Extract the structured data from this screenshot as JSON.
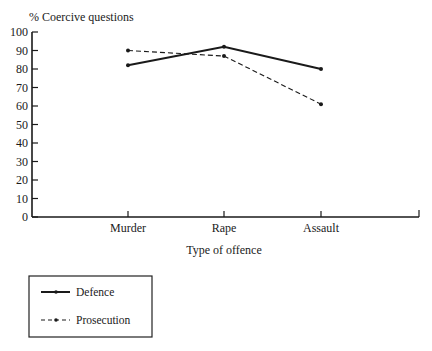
{
  "chart_data": {
    "type": "line",
    "title": "",
    "ylabel": "% Coercive questions",
    "xlabel": "Type of offence",
    "ylim": [
      0,
      100
    ],
    "yticks": [
      0,
      10,
      20,
      30,
      40,
      50,
      60,
      70,
      80,
      90,
      100
    ],
    "categories": [
      "Murder",
      "Rape",
      "Assault"
    ],
    "grid": false,
    "legend_position": "bottom-left",
    "series": [
      {
        "name": "Defence",
        "style": "solid",
        "values": [
          82,
          92,
          80
        ]
      },
      {
        "name": "Prosecution",
        "style": "dashed",
        "values": [
          90,
          87,
          61
        ]
      }
    ]
  }
}
